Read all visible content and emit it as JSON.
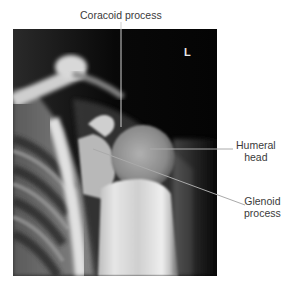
{
  "figure": {
    "type": "radiograph",
    "region": "shoulder",
    "side_marker": "L",
    "labels": {
      "coracoid": "Coracoid process",
      "humeral_head_line1": "Humeral",
      "humeral_head_line2": "head",
      "glenoid_line1": "Glenoid",
      "glenoid_line2": "process"
    }
  }
}
